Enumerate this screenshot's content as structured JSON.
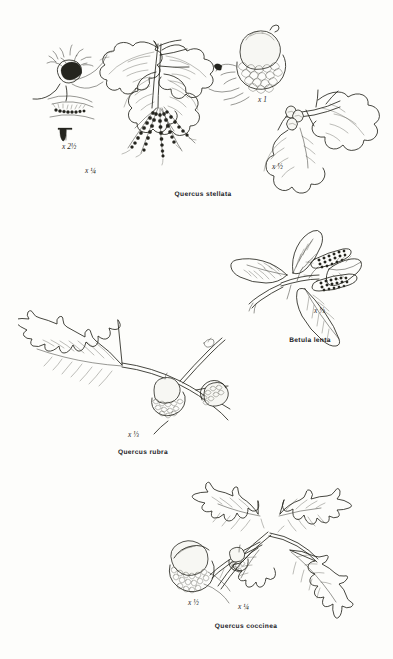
{
  "plate": {
    "type": "botanical-illustration-plate",
    "medium": "pen-and-ink line drawing",
    "background_color": "#fdfdfb",
    "ink_color": "#26261f",
    "page_width": 393,
    "page_height": 659,
    "panel_count": 4
  },
  "panels": [
    {
      "id": "quercus-stellata",
      "caption": "Quercus stellata",
      "common_subject": "post oak",
      "caption_x": 203,
      "caption_y": 196,
      "figures": [
        {
          "name": "pistillate-flower-detail",
          "magnification": "x 2½",
          "label_x": 68,
          "label_y": 148,
          "description": "enlarged flower cluster with stellate hairs"
        },
        {
          "name": "leafy-twig-with-staminate-catkins",
          "magnification": "x ¼",
          "label_x": 91,
          "label_y": 172,
          "description": "branch with cross-shaped lobed leaves and pendulous catkins"
        },
        {
          "name": "acorn-detail",
          "magnification": "x 1",
          "label_x": 262,
          "label_y": 101,
          "description": "single acorn with scaly cup"
        },
        {
          "name": "fruiting-twig",
          "magnification": "x ½",
          "label_x": 277,
          "label_y": 168,
          "description": "twig with leaves and small acorns"
        }
      ]
    },
    {
      "id": "betula-lenta",
      "caption": "Betula lenta",
      "common_subject": "sweet birch",
      "caption_x": 310,
      "caption_y": 342,
      "figures": [
        {
          "name": "leafy-twig-with-strobiles",
          "magnification": "x ⅓",
          "label_x": 320,
          "label_y": 312,
          "description": "branch with toothed ovate leaves and two erect cone-like strobiles"
        }
      ]
    },
    {
      "id": "quercus-rubra",
      "caption": "Quercus rubra",
      "common_subject": "northern red oak",
      "caption_x": 143,
      "caption_y": 454,
      "figures": [
        {
          "name": "fruiting-twig",
          "magnification": "x ⅓",
          "label_x": 133,
          "label_y": 436,
          "description": "branch with deeply lobed bristle-tipped leaf and two acorns"
        }
      ]
    },
    {
      "id": "quercus-coccinea",
      "caption": "Quercus coccinea",
      "common_subject": "scarlet oak",
      "caption_x": 246,
      "caption_y": 628,
      "figures": [
        {
          "name": "acorn-detail",
          "magnification": "x ½",
          "label_x": 192,
          "label_y": 604,
          "description": "large acorn with deep scaly cup"
        },
        {
          "name": "fruiting-twig",
          "magnification": "x ¼",
          "label_x": 242,
          "label_y": 608,
          "description": "branch with deeply dissected leaves and small acorn"
        }
      ]
    }
  ]
}
